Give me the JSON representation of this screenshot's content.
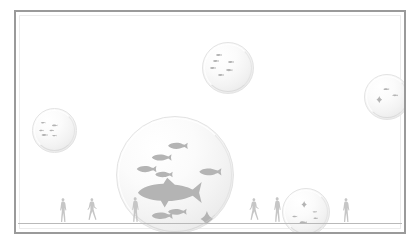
{
  "scene": {
    "title": "Fish scale comparison bubbles",
    "background_color": "#ffffff",
    "frame_color": "#9a9a9a",
    "ground_line_color": "#b9b9b9",
    "silhouette_color": "#b4b4b4",
    "human_color": "#c6c6c6",
    "bubble_fill_light": "#ffffff",
    "bubble_fill_shadow": "#e4e4e4",
    "bubble_edge_color": "#e3e3e3"
  },
  "bubbles": [
    {
      "id": "bubble-large-center",
      "label": "Large central bubble",
      "x": 100,
      "y": 104,
      "size": 118,
      "contents": "school of fish with one large fish and a ray",
      "creatures": [
        {
          "kind": "fish",
          "x": 44,
          "y": 22,
          "len": 17,
          "flip": false
        },
        {
          "kind": "fish",
          "x": 30,
          "y": 32,
          "len": 17,
          "flip": false
        },
        {
          "kind": "fish",
          "x": 17,
          "y": 42,
          "len": 17,
          "flip": false
        },
        {
          "kind": "fish",
          "x": 33,
          "y": 47,
          "len": 15,
          "flip": false
        },
        {
          "kind": "fish",
          "x": 71,
          "y": 44,
          "len": 19,
          "flip": false
        },
        {
          "kind": "fish-large",
          "x": 18,
          "y": 56,
          "len": 55,
          "flip": false
        },
        {
          "kind": "fish",
          "x": 30,
          "y": 82,
          "len": 18,
          "flip": false
        },
        {
          "kind": "fish",
          "x": 44,
          "y": 79,
          "len": 16,
          "flip": false
        },
        {
          "kind": "ray",
          "x": 72,
          "y": 81,
          "len": 11,
          "flip": false
        }
      ]
    },
    {
      "id": "bubble-top-center",
      "label": "Top center bubble",
      "x": 186,
      "y": 30,
      "size": 52,
      "contents": "school of small fish",
      "creatures": [
        {
          "kind": "fish",
          "x": 26,
          "y": 22,
          "len": 12,
          "flip": false
        },
        {
          "kind": "fish",
          "x": 20,
          "y": 34,
          "len": 12,
          "flip": false
        },
        {
          "kind": "fish",
          "x": 50,
          "y": 36,
          "len": 12,
          "flip": false
        },
        {
          "kind": "fish",
          "x": 14,
          "y": 48,
          "len": 12,
          "flip": false
        },
        {
          "kind": "fish",
          "x": 46,
          "y": 52,
          "len": 13,
          "flip": false
        },
        {
          "kind": "fish",
          "x": 30,
          "y": 62,
          "len": 12,
          "flip": false
        }
      ]
    },
    {
      "id": "bubble-left",
      "label": "Left bubble",
      "x": 16,
      "y": 96,
      "size": 45,
      "contents": "school of small fish",
      "creatures": [
        {
          "kind": "fish",
          "x": 18,
          "y": 30,
          "len": 11,
          "flip": false
        },
        {
          "kind": "fish",
          "x": 44,
          "y": 36,
          "len": 13,
          "flip": false
        },
        {
          "kind": "fish",
          "x": 14,
          "y": 48,
          "len": 11,
          "flip": false
        },
        {
          "kind": "fish",
          "x": 38,
          "y": 48,
          "len": 11,
          "flip": false
        },
        {
          "kind": "fish",
          "x": 20,
          "y": 58,
          "len": 14,
          "flip": false
        },
        {
          "kind": "fish",
          "x": 44,
          "y": 60,
          "len": 11,
          "flip": false
        }
      ]
    },
    {
      "id": "bubble-top-right",
      "label": "Top right bubble",
      "x": 348,
      "y": 62,
      "size": 46,
      "contents": "ray and two fish",
      "creatures": [
        {
          "kind": "fish",
          "x": 42,
          "y": 30,
          "len": 13,
          "flip": false
        },
        {
          "kind": "fish",
          "x": 62,
          "y": 44,
          "len": 13,
          "flip": false
        },
        {
          "kind": "ray",
          "x": 26,
          "y": 48,
          "len": 13,
          "flip": false
        }
      ]
    },
    {
      "id": "bubble-bottom-right",
      "label": "Bottom right bubble",
      "x": 266,
      "y": 176,
      "size": 48,
      "contents": "ray and small fish",
      "creatures": [
        {
          "kind": "ray",
          "x": 40,
          "y": 26,
          "len": 12,
          "flip": false
        },
        {
          "kind": "fish",
          "x": 64,
          "y": 48,
          "len": 10,
          "flip": false
        },
        {
          "kind": "fish",
          "x": 20,
          "y": 58,
          "len": 11,
          "flip": false
        },
        {
          "kind": "fish",
          "x": 66,
          "y": 62,
          "len": 10,
          "flip": false
        },
        {
          "kind": "fish",
          "x": 36,
          "y": 70,
          "len": 16,
          "flip": false
        }
      ]
    }
  ],
  "humans": [
    {
      "id": "human-1",
      "pose": "standing",
      "x": 42,
      "h": 26
    },
    {
      "id": "human-2",
      "pose": "walking",
      "x": 71,
      "h": 26
    },
    {
      "id": "human-3",
      "pose": "standing",
      "x": 114,
      "h": 27
    },
    {
      "id": "human-4",
      "pose": "walking",
      "x": 233,
      "h": 26
    },
    {
      "id": "human-5",
      "pose": "standing",
      "x": 256,
      "h": 27
    },
    {
      "id": "human-6",
      "pose": "standing",
      "x": 325,
      "h": 26
    },
    {
      "id": "human-7",
      "pose": "standing",
      "x": 387,
      "h": 28
    }
  ]
}
